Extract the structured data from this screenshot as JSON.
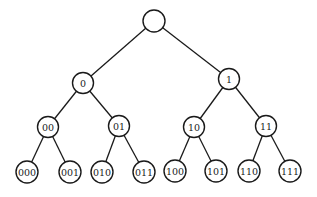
{
  "diagram": {
    "type": "binary-tree",
    "colors": {
      "stroke": "#1a1a1a",
      "fill": "#ffffff",
      "background": "#ffffff"
    },
    "nodes": [
      {
        "id": "root",
        "label": "",
        "level": 0
      },
      {
        "id": "n0",
        "label": "0",
        "level": 1,
        "parent": "root"
      },
      {
        "id": "n1",
        "label": "1",
        "level": 1,
        "parent": "root"
      },
      {
        "id": "n00",
        "label": "00",
        "level": 2,
        "parent": "n0"
      },
      {
        "id": "n01",
        "label": "01",
        "level": 2,
        "parent": "n0"
      },
      {
        "id": "n10",
        "label": "10",
        "level": 2,
        "parent": "n1"
      },
      {
        "id": "n11",
        "label": "11",
        "level": 2,
        "parent": "n1"
      },
      {
        "id": "n000",
        "label": "000",
        "level": 3,
        "parent": "n00"
      },
      {
        "id": "n001",
        "label": "001",
        "level": 3,
        "parent": "n00"
      },
      {
        "id": "n010",
        "label": "010",
        "level": 3,
        "parent": "n01"
      },
      {
        "id": "n011",
        "label": "011",
        "level": 3,
        "parent": "n01"
      },
      {
        "id": "n100",
        "label": "100",
        "level": 3,
        "parent": "n10"
      },
      {
        "id": "n101",
        "label": "101",
        "level": 3,
        "parent": "n10"
      },
      {
        "id": "n110",
        "label": "110",
        "level": 3,
        "parent": "n11"
      },
      {
        "id": "n111",
        "label": "111",
        "level": 3,
        "parent": "n11"
      }
    ]
  }
}
